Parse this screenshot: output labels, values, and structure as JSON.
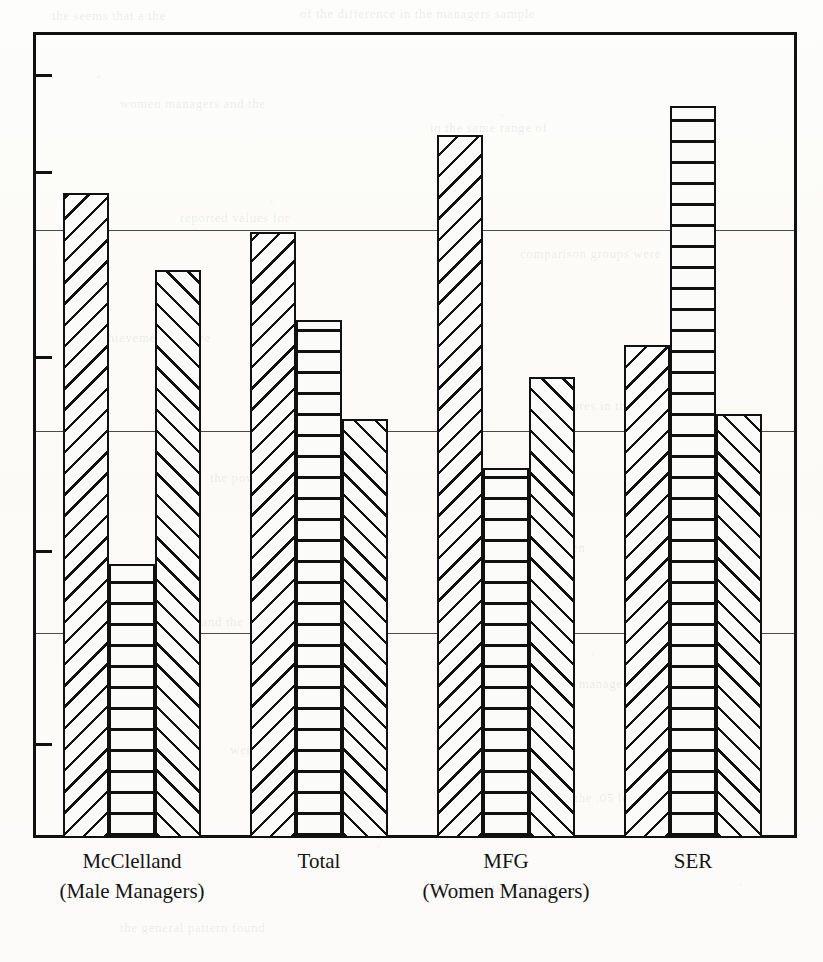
{
  "figure": {
    "kind": "scanned-grouped-bar-chart",
    "axis": {
      "gridline_values": [
        75,
        50,
        25
      ],
      "tick_values": [
        94,
        82,
        59,
        35,
        11
      ]
    },
    "ghost_text": [
      {
        "text": "the  seems  that  a  the",
        "x": 52,
        "y": 8
      },
      {
        "text": "of  the  difference  in  the  managers  sample",
        "x": 300,
        "y": 6
      },
      {
        "text": "women  managers  and  the",
        "x": 120,
        "y": 96
      },
      {
        "text": "in  the  same  range  of",
        "x": 430,
        "y": 120
      },
      {
        "text": "reported  values  for",
        "x": 180,
        "y": 210
      },
      {
        "text": "comparison  groups  were",
        "x": 520,
        "y": 246
      },
      {
        "text": "achievement  motive",
        "x": 95,
        "y": 330
      },
      {
        "text": "scores  in  the  study",
        "x": 560,
        "y": 398
      },
      {
        "text": "the  power  motive",
        "x": 210,
        "y": 470
      },
      {
        "text": "differences  between",
        "x": 470,
        "y": 540
      },
      {
        "text": "affiliation  and  the",
        "x": 140,
        "y": 614
      },
      {
        "text": "groups  of  managers",
        "x": 520,
        "y": 676
      },
      {
        "text": "were  not  significant",
        "x": 230,
        "y": 742
      },
      {
        "text": "at  the  .05  level  of",
        "x": 560,
        "y": 790
      },
      {
        "text": "these  results  support",
        "x": 430,
        "y": 880
      },
      {
        "text": "the  general  pattern  found",
        "x": 120,
        "y": 920
      }
    ]
  },
  "chart_data": {
    "type": "bar",
    "title": "",
    "xlabel": "",
    "ylabel": "",
    "ylim": [
      0,
      100
    ],
    "grid": true,
    "legend_position": "none",
    "categories": [
      "McClelland",
      "Total",
      "MFG",
      "SER"
    ],
    "category_sublabels": [
      "(Male Managers)",
      "",
      "",
      ""
    ],
    "group_note": "(Women Managers)",
    "group_note_spans": [
      "Total",
      "MFG",
      "SER"
    ],
    "series": [
      {
        "name": "Series 1",
        "pattern": "diagonal-backslash",
        "values": [
          80.0,
          75.2,
          87.2,
          61.2
        ]
      },
      {
        "name": "Series 2",
        "pattern": "horizontal-lines",
        "values": [
          34.0,
          64.3,
          45.9,
          90.8
        ]
      },
      {
        "name": "Series 3",
        "pattern": "diagonal-forwardslash",
        "values": [
          70.5,
          52.0,
          57.2,
          52.6
        ]
      }
    ]
  },
  "colors": {
    "ink": "#111111",
    "grid": "#4a4a4a",
    "paper": "#fdfdfb"
  }
}
